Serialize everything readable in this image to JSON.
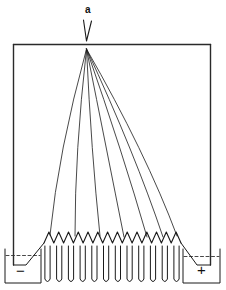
{
  "diagram": {
    "labels": {
      "point": "a",
      "negative": "−",
      "positive": "+"
    },
    "colors": {
      "line": "#1a1a1a",
      "frame": "#2a2a2a",
      "background": "#ffffff"
    },
    "components": {
      "electroscope_tip": "V-shaped leaf at point a",
      "frame": "rectangular conducting wire frame",
      "fan_lines": 7,
      "zigzag_teeth": 14,
      "u_tubes": 12,
      "beakers": [
        "negative",
        "positive"
      ]
    }
  }
}
